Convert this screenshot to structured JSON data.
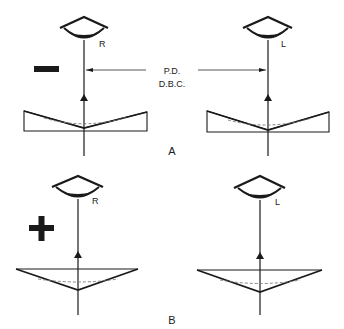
{
  "colors": {
    "ink": "#1a1a1a",
    "dash": "#777777",
    "background": "#ffffff"
  },
  "panel_a": {
    "label": "A",
    "sign": "minus",
    "right_eye_label": "R",
    "left_eye_label": "L",
    "distance_label_line1": "P.D.",
    "distance_label_line2": "D.B.C.",
    "prism_orientation": "base-out"
  },
  "panel_b": {
    "label": "B",
    "sign": "plus",
    "right_eye_label": "R",
    "left_eye_label": "L",
    "prism_orientation": "base-in"
  }
}
